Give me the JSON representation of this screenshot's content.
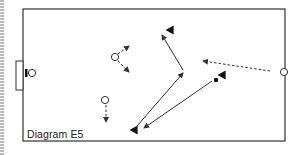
{
  "diagram": {
    "caption": "Diagram E5",
    "colors": {
      "line": "#333333",
      "background": "#ffffff",
      "border_stripe": "#bbbbbb"
    },
    "field": {
      "x": 23,
      "y": 9,
      "width": 262,
      "height": 132
    },
    "goal": {
      "x": 16,
      "y": 61,
      "width": 7,
      "height": 29
    },
    "players_circle": [
      {
        "id": "keeper",
        "x": 32,
        "y": 73
      },
      {
        "id": "mid-top",
        "x": 115,
        "y": 57
      },
      {
        "id": "mid-bottom",
        "x": 105,
        "y": 100
      },
      {
        "id": "right-edge",
        "x": 284,
        "y": 72
      }
    ],
    "players_triangle": [
      {
        "id": "top",
        "x": 170,
        "y": 30
      },
      {
        "id": "center-right",
        "x": 222,
        "y": 75
      },
      {
        "id": "bottom-left",
        "x": 134,
        "y": 130
      }
    ],
    "ball": {
      "x": 216,
      "y": 80
    },
    "arrows": [
      {
        "style": "dashed",
        "from": [
          118,
          54
        ],
        "to": [
          129,
          46
        ]
      },
      {
        "style": "dashed",
        "from": [
          118,
          61
        ],
        "to": [
          129,
          72
        ]
      },
      {
        "style": "dashed",
        "from": [
          106,
          105
        ],
        "to": [
          106,
          122
        ]
      },
      {
        "style": "dashed",
        "from": [
          270,
          71
        ],
        "to": [
          203,
          61
        ]
      },
      {
        "style": "solid",
        "from": [
          183,
          70
        ],
        "to": [
          162,
          35
        ]
      },
      {
        "style": "solid",
        "from": [
          137,
          126
        ],
        "to": [
          183,
          73
        ]
      },
      {
        "style": "solid",
        "from": [
          212,
          81
        ],
        "to": [
          144,
          128
        ]
      }
    ]
  }
}
